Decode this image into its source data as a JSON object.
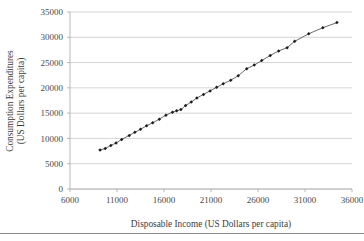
{
  "chart_data": {
    "type": "scatter",
    "title": "",
    "xlabel": "Disposable Income (US Dollars per capita)",
    "ylabel_line1": "Consumption Expenditures",
    "ylabel_line2": "(US Dollars per capita)",
    "xlim": [
      6000,
      36000
    ],
    "ylim": [
      0,
      35000
    ],
    "xticks": [
      6000,
      11000,
      16000,
      21000,
      26000,
      31000,
      36000
    ],
    "yticks": [
      0,
      5000,
      10000,
      15000,
      20000,
      25000,
      30000,
      35000
    ],
    "xtick_labels": [
      "6000",
      "11000",
      "16000",
      "21000",
      "26000",
      "31000",
      "36000"
    ],
    "ytick_labels": [
      "0",
      "5000",
      "10000",
      "15000",
      "20000",
      "25000",
      "30000",
      "35000"
    ],
    "grid": "horizontal",
    "legend": "none",
    "marker_style": "filled-diamond",
    "series": [
      {
        "name": "Consumption vs Disposable Income",
        "points": [
          [
            9200,
            7700
          ],
          [
            9750,
            8000
          ],
          [
            10350,
            8600
          ],
          [
            10900,
            9100
          ],
          [
            11500,
            9800
          ],
          [
            12300,
            10600
          ],
          [
            12900,
            11200
          ],
          [
            13500,
            11800
          ],
          [
            14150,
            12500
          ],
          [
            14800,
            13100
          ],
          [
            15500,
            13800
          ],
          [
            16200,
            14600
          ],
          [
            16900,
            15200
          ],
          [
            17350,
            15450
          ],
          [
            17800,
            15700
          ],
          [
            18300,
            16500
          ],
          [
            18900,
            17200
          ],
          [
            19500,
            18000
          ],
          [
            20200,
            18700
          ],
          [
            20900,
            19400
          ],
          [
            21600,
            20100
          ],
          [
            22300,
            20800
          ],
          [
            23100,
            21500
          ],
          [
            23900,
            22400
          ],
          [
            24800,
            23800
          ],
          [
            25600,
            24500
          ],
          [
            26400,
            25400
          ],
          [
            27300,
            26400
          ],
          [
            28200,
            27300
          ],
          [
            29100,
            27950
          ],
          [
            29900,
            29200
          ],
          [
            31400,
            30700
          ],
          [
            32900,
            31900
          ],
          [
            34400,
            32900
          ]
        ]
      }
    ]
  },
  "plot_geometry": {
    "left": 70,
    "right": 352,
    "top": 12,
    "bottom": 189
  }
}
